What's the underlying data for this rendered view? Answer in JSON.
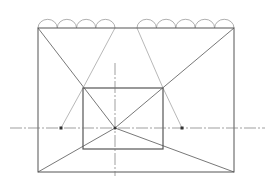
{
  "diagram": {
    "type": "one-point perspective construction",
    "canvas": {
      "width": 274,
      "height": 187,
      "background": "#ffffff"
    },
    "colors": {
      "main_line": "#555555",
      "light_line": "#9a9a9a",
      "center_line": "#777777"
    },
    "outer_rect": {
      "x1": 38,
      "y1": 28,
      "x2": 234,
      "y2": 172
    },
    "inner_rect": {
      "x1": 83,
      "y1": 88,
      "x2": 163,
      "y2": 149
    },
    "vanishing_point": {
      "x": 115,
      "y": 128
    },
    "horizon_line": {
      "x1": 10,
      "x2": 265,
      "y": 128
    },
    "vertical_axis": {
      "x": 115,
      "y1": 63,
      "y2": 176
    },
    "measuring_points": [
      {
        "x": 61,
        "y": 128
      },
      {
        "x": 182,
        "y": 128
      }
    ],
    "arcs_left": {
      "start_x": 38,
      "end_x": 115,
      "y": 28,
      "count": 4
    },
    "arcs_right": {
      "start_x": 137,
      "end_x": 234,
      "y": 28,
      "count": 5
    }
  }
}
